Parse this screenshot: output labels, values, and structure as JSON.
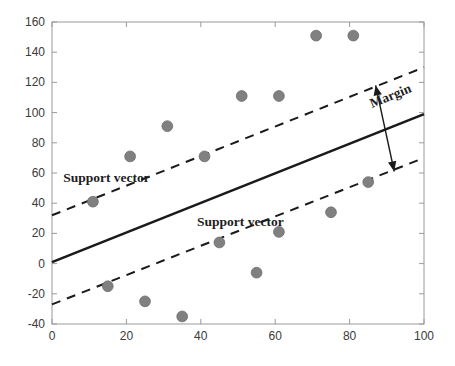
{
  "chart_data": {
    "type": "scatter",
    "title": "",
    "xlabel": "",
    "ylabel": "",
    "xlim": [
      0,
      100
    ],
    "ylim": [
      -40,
      160
    ],
    "grid": false,
    "legend": null,
    "xticks": [
      "0",
      "20",
      "40",
      "60",
      "80",
      "100"
    ],
    "xtick_values": [
      0,
      20,
      40,
      60,
      80,
      100
    ],
    "yticks": [
      "160",
      "140",
      "120",
      "100",
      "80",
      "60",
      "40",
      "20",
      "0",
      "-20",
      "-40"
    ],
    "ytick_values": [
      160,
      140,
      120,
      100,
      80,
      60,
      40,
      20,
      0,
      -20,
      -40
    ],
    "point_color": "#808080",
    "line_color": "#1a1a1a",
    "series": [
      {
        "name": "data points",
        "marker": "circle",
        "color": "#808080",
        "points": [
          {
            "x": 11,
            "y": 41
          },
          {
            "x": 15,
            "y": -15
          },
          {
            "x": 21,
            "y": 71
          },
          {
            "x": 25,
            "y": -25
          },
          {
            "x": 31,
            "y": 91
          },
          {
            "x": 35,
            "y": -35
          },
          {
            "x": 41,
            "y": 71
          },
          {
            "x": 45,
            "y": 14
          },
          {
            "x": 51,
            "y": 111
          },
          {
            "x": 55,
            "y": -6
          },
          {
            "x": 61,
            "y": 111
          },
          {
            "x": 61,
            "y": 21
          },
          {
            "x": 71,
            "y": 151
          },
          {
            "x": 75,
            "y": 34
          },
          {
            "x": 81,
            "y": 151
          },
          {
            "x": 85,
            "y": 54
          }
        ]
      }
    ],
    "lines": [
      {
        "name": "decision-boundary",
        "style": "solid",
        "color": "#1a1a1a",
        "x": [
          0,
          100
        ],
        "y": [
          1,
          99
        ]
      },
      {
        "name": "upper-margin",
        "style": "dashed",
        "color": "#1a1a1a",
        "x": [
          0,
          100
        ],
        "y": [
          32,
          130
        ]
      },
      {
        "name": "lower-margin",
        "style": "dashed",
        "color": "#1a1a1a",
        "x": [
          0,
          100
        ],
        "y": [
          -27,
          70
        ]
      }
    ],
    "annotations": [
      {
        "name": "support-vector-upper",
        "text": "Support vector",
        "x": 3,
        "y": 54
      },
      {
        "name": "support-vector-lower",
        "text": "Support vector",
        "x": 39,
        "y": 25
      },
      {
        "name": "margin",
        "text": "Margin",
        "x": 86,
        "y": 103,
        "rotation": -22
      },
      {
        "name": "margin-arrow",
        "type": "double-arrow",
        "x1": 87,
        "y1": 118,
        "x2": 92,
        "y2": 61
      }
    ]
  }
}
